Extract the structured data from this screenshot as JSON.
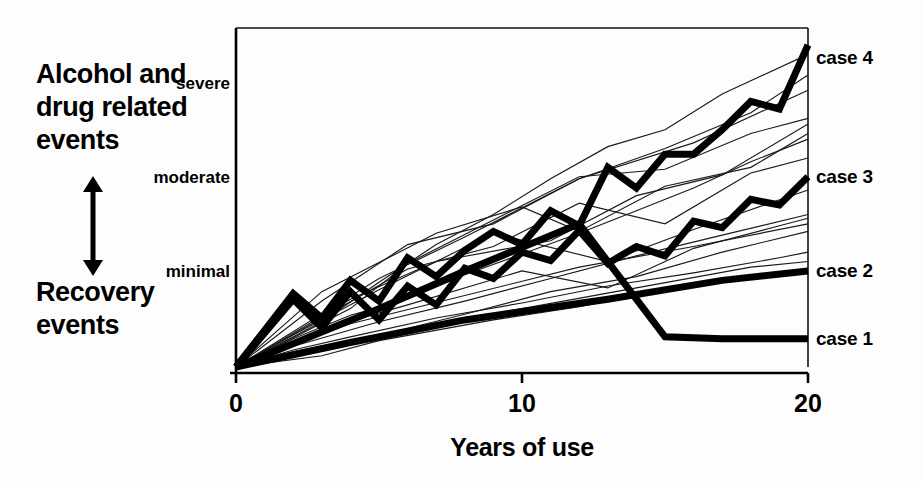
{
  "figure": {
    "left_caption_top": "Alcohol and\ndrug related\nevents",
    "left_caption_bottom": "Recovery\nevents",
    "direction_arrow_icon": "double-headed-vertical-arrow-icon"
  },
  "chart_data": {
    "type": "line",
    "title": "",
    "xlabel": "Years of use",
    "ylabel": "",
    "xlim": [
      0,
      20
    ],
    "ylim": [
      0,
      3.6
    ],
    "xticks": [
      0,
      10,
      20
    ],
    "xticklabels": [
      "0",
      "10",
      "20"
    ],
    "yticklabels": [
      "minimal",
      "moderate",
      "severe"
    ],
    "ytickvalues": [
      1,
      2,
      3
    ],
    "grid": false,
    "legend_position": "right-of-axes",
    "series": [
      {
        "name": "case 1",
        "label": "case 1",
        "emphasis": "thick",
        "x": [
          0,
          5,
          8,
          12,
          15,
          17,
          20
        ],
        "y": [
          0.0,
          0.62,
          1.02,
          1.52,
          0.32,
          0.3,
          0.3
        ]
      },
      {
        "name": "case 2",
        "label": "case 2",
        "emphasis": "thick",
        "x": [
          0,
          4,
          8,
          13,
          17,
          20
        ],
        "y": [
          0.0,
          0.26,
          0.5,
          0.72,
          0.92,
          1.02
        ]
      },
      {
        "name": "case 3",
        "label": "case 3",
        "emphasis": "thick",
        "x": [
          0,
          2,
          3,
          4,
          5,
          6,
          7,
          8,
          9,
          10,
          11,
          12,
          13,
          14,
          15,
          16,
          17,
          18,
          19,
          20
        ],
        "y": [
          0.0,
          0.72,
          0.42,
          0.8,
          0.5,
          0.86,
          0.66,
          1.05,
          0.94,
          1.22,
          1.13,
          1.45,
          1.1,
          1.28,
          1.18,
          1.55,
          1.48,
          1.78,
          1.72,
          2.02
        ]
      },
      {
        "name": "case 4",
        "label": "case 4",
        "emphasis": "thick",
        "x": [
          0,
          2,
          3,
          4,
          5,
          6,
          7,
          8,
          9,
          10,
          11,
          12,
          13,
          14,
          15,
          16,
          17,
          18,
          19,
          20
        ],
        "y": [
          0.0,
          0.78,
          0.52,
          0.92,
          0.7,
          1.16,
          0.96,
          1.24,
          1.44,
          1.3,
          1.66,
          1.5,
          2.12,
          1.9,
          2.26,
          2.26,
          2.52,
          2.82,
          2.74,
          3.42
        ]
      }
    ],
    "background_series_count": 16,
    "background_series": [
      {
        "x": [
          0,
          2,
          4,
          6,
          8,
          10,
          12,
          14,
          16,
          18,
          20
        ],
        "y": [
          0,
          0.3,
          0.55,
          0.72,
          0.98,
          1.2,
          1.42,
          1.66,
          1.9,
          2.18,
          2.42
        ]
      },
      {
        "x": [
          0,
          3,
          5,
          7,
          9,
          11,
          13,
          15,
          17,
          20
        ],
        "y": [
          0,
          0.48,
          0.9,
          1.3,
          1.62,
          2.0,
          2.34,
          2.52,
          2.9,
          3.32
        ]
      },
      {
        "x": [
          0,
          2,
          5,
          8,
          11,
          14,
          17,
          20
        ],
        "y": [
          0,
          0.22,
          0.48,
          0.7,
          0.94,
          1.18,
          1.4,
          1.62
        ]
      },
      {
        "x": [
          0,
          4,
          6,
          9,
          12,
          15,
          18,
          20
        ],
        "y": [
          0,
          0.62,
          1.1,
          1.56,
          2.02,
          2.1,
          2.48,
          2.64
        ]
      },
      {
        "x": [
          0,
          2,
          4,
          7,
          10,
          13,
          16,
          19,
          20
        ],
        "y": [
          0,
          0.18,
          0.32,
          0.52,
          0.68,
          0.86,
          1.0,
          1.16,
          1.22
        ]
      },
      {
        "x": [
          0,
          3,
          6,
          9,
          12,
          15,
          18,
          20
        ],
        "y": [
          0,
          0.7,
          1.3,
          1.52,
          2.0,
          2.32,
          2.7,
          3.1
        ]
      },
      {
        "x": [
          0,
          2,
          5,
          9,
          13,
          16,
          20
        ],
        "y": [
          0,
          0.34,
          0.82,
          1.42,
          1.12,
          1.46,
          1.88
        ]
      },
      {
        "x": [
          0,
          4,
          8,
          11,
          14,
          17,
          20
        ],
        "y": [
          0,
          0.26,
          0.56,
          0.8,
          0.96,
          1.22,
          1.44
        ]
      },
      {
        "x": [
          0,
          3,
          7,
          10,
          12,
          15,
          18,
          20
        ],
        "y": [
          0,
          0.8,
          1.42,
          1.7,
          1.44,
          1.92,
          2.12,
          2.48
        ]
      },
      {
        "x": [
          0,
          2,
          6,
          10,
          14,
          18,
          20
        ],
        "y": [
          0,
          0.16,
          0.4,
          0.62,
          0.84,
          1.06,
          1.12
        ]
      },
      {
        "x": [
          0,
          5,
          8,
          12,
          16,
          20
        ],
        "y": [
          0,
          0.94,
          1.38,
          2.0,
          2.38,
          2.94
        ]
      },
      {
        "x": [
          0,
          3,
          6,
          10,
          13,
          16,
          19,
          20
        ],
        "y": [
          0,
          0.4,
          0.66,
          1.02,
          0.84,
          1.26,
          1.5,
          1.58
        ]
      },
      {
        "x": [
          0,
          2,
          4,
          8,
          12,
          16,
          20
        ],
        "y": [
          0,
          0.24,
          0.46,
          0.76,
          1.06,
          1.28,
          1.52
        ]
      },
      {
        "x": [
          0,
          6,
          9,
          12,
          15,
          18,
          20
        ],
        "y": [
          0,
          1.04,
          1.28,
          1.74,
          1.52,
          2.06,
          2.22
        ]
      },
      {
        "x": [
          0,
          3,
          5,
          9,
          12,
          15,
          18,
          20
        ],
        "y": [
          0,
          0.12,
          0.28,
          0.5,
          0.64,
          0.82,
          0.94,
          1.04
        ]
      },
      {
        "x": [
          0,
          4,
          7,
          11,
          14,
          17,
          20
        ],
        "y": [
          0,
          0.72,
          1.12,
          1.34,
          1.82,
          2.04,
          2.58
        ]
      }
    ]
  }
}
